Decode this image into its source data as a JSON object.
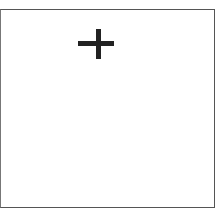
{
  "tile": {
    "action": "add",
    "icon": "plus-icon",
    "border_color": "#555555",
    "icon_color": "#222222"
  }
}
